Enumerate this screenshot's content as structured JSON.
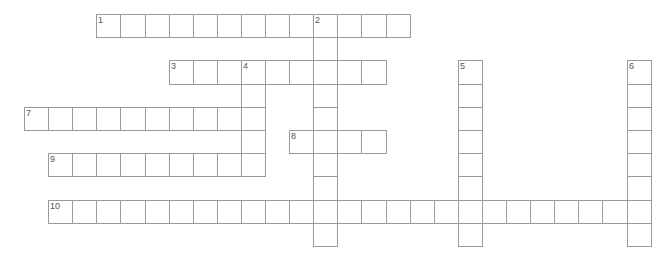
{
  "puzzle": {
    "grid": {
      "origin_x": 24,
      "origin_y": 14,
      "cell_width": 24.1,
      "cell_height": 23.2,
      "line_color": "#9a9a9a",
      "number_color": "#555555",
      "background": "#ffffff"
    },
    "words": [
      {
        "number": "1",
        "direction": "across",
        "row": 0,
        "col": 3,
        "length": 13
      },
      {
        "number": "2",
        "direction": "down",
        "row": 0,
        "col": 12,
        "length": 10
      },
      {
        "number": "3",
        "direction": "across",
        "row": 2,
        "col": 6,
        "length": 9
      },
      {
        "number": "4",
        "direction": "down",
        "row": 2,
        "col": 9,
        "length": 5
      },
      {
        "number": "5",
        "direction": "down",
        "row": 2,
        "col": 18,
        "length": 8
      },
      {
        "number": "6",
        "direction": "down",
        "row": 2,
        "col": 25,
        "length": 8
      },
      {
        "number": "7",
        "direction": "across",
        "row": 4,
        "col": 0,
        "length": 10
      },
      {
        "number": "8",
        "direction": "across",
        "row": 5,
        "col": 11,
        "length": 4
      },
      {
        "number": "9",
        "direction": "across",
        "row": 6,
        "col": 1,
        "length": 9
      },
      {
        "number": "10",
        "direction": "across",
        "row": 8,
        "col": 1,
        "length": 25
      }
    ],
    "entries": {}
  }
}
